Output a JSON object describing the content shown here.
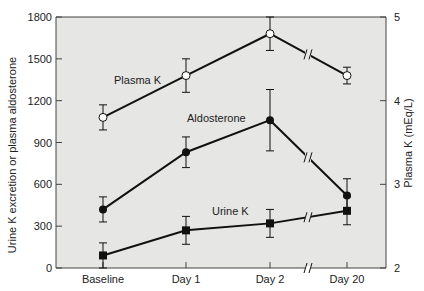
{
  "chart_data": {
    "type": "line",
    "title": "",
    "categories": [
      "Baseline",
      "Day 1",
      "Day 2",
      "Day 20"
    ],
    "xlabel": "",
    "ylabel": "Urine K excretion or plasma aldosterone",
    "y2label": "Plasma K (mEq/L)",
    "ylim": [
      0,
      1800
    ],
    "y2lim": [
      2,
      5
    ],
    "yticks": [
      0,
      300,
      600,
      900,
      1200,
      1500,
      1800
    ],
    "y2ticks": [
      2,
      3,
      4,
      5
    ],
    "grid": false,
    "axis_break_between": [
      "Day 2",
      "Day 20"
    ],
    "series": [
      {
        "name": "Plasma K",
        "axis": "right",
        "marker": "open-circle",
        "values": [
          3.8,
          4.3,
          4.8,
          4.3
        ],
        "errors": [
          0.15,
          0.2,
          0.2,
          0.1
        ]
      },
      {
        "name": "Aldosterone",
        "axis": "left",
        "marker": "filled-circle",
        "values": [
          420,
          830,
          1060,
          520
        ],
        "errors": [
          90,
          110,
          220,
          120
        ]
      },
      {
        "name": "Urine K",
        "axis": "left",
        "marker": "filled-square",
        "values": [
          90,
          270,
          320,
          410
        ],
        "errors": [
          90,
          100,
          100,
          100
        ]
      }
    ],
    "annotations": [
      {
        "text": "Plasma K",
        "near": "Baseline-Day 1 upper line"
      },
      {
        "text": "Aldosterone",
        "near": "Day 1-Day 2 middle line"
      },
      {
        "text": "Urine K",
        "near": "Day 1-Day 2 lower line"
      }
    ]
  },
  "labels": {
    "y_title": "Urine K excretion or plasma aldosterone",
    "y2_title": "Plasma K (mEq/L)",
    "plasma_k": "Plasma K",
    "aldosterone": "Aldosterone",
    "urine_k": "Urine K"
  },
  "colors": {
    "plot_bg": "#e6e6e4",
    "line": "#111111",
    "axis": "#444444"
  }
}
